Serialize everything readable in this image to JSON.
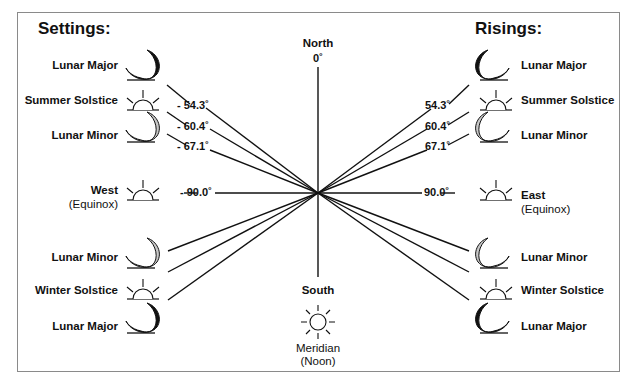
{
  "left_panel": {
    "title": "Settings:",
    "items": [
      {
        "label": "Lunar Major",
        "icon": "moon-black",
        "angle": "- 54.3˚"
      },
      {
        "label": "Summer Solstice",
        "icon": "sun-rising",
        "angle": "- 60.4˚"
      },
      {
        "label": "Lunar Minor",
        "icon": "moon-gray",
        "angle": "- 67.1˚"
      },
      {
        "label": "West",
        "sublabel": "(Equinox)",
        "icon": "sun-rising",
        "angle": "- 90.0˚"
      },
      {
        "label": "Lunar Minor",
        "icon": "moon-gray"
      },
      {
        "label": "Winter Solstice",
        "icon": "sun-rising"
      },
      {
        "label": "Lunar Major",
        "icon": "moon-black"
      }
    ]
  },
  "right_panel": {
    "title": "Risings:",
    "items": [
      {
        "label": "Lunar Major",
        "icon": "moon-black",
        "angle": "54.3˚"
      },
      {
        "label": "Summer Solstice",
        "icon": "sun-rising",
        "angle": "60.4˚"
      },
      {
        "label": "Lunar Minor",
        "icon": "moon-gray",
        "angle": "67.1˚"
      },
      {
        "label": "East",
        "sublabel": "(Equinox)",
        "icon": "sun-rising",
        "angle": "90.0˚"
      },
      {
        "label": "Lunar Minor",
        "icon": "moon-gray"
      },
      {
        "label": "Winter Solstice",
        "icon": "sun-rising"
      },
      {
        "label": "Lunar Major",
        "icon": "moon-black"
      }
    ]
  },
  "center": {
    "north_label": "North",
    "north_angle": "0˚",
    "south_label": "South",
    "south_icon": "sun-full",
    "meridian_label": "Meridian",
    "meridian_sub": "(Noon)"
  },
  "colors": {
    "line": "#111111",
    "moon_major": "#111111",
    "moon_minor": "#c8c8c8",
    "frame": "#8a8a8a"
  }
}
